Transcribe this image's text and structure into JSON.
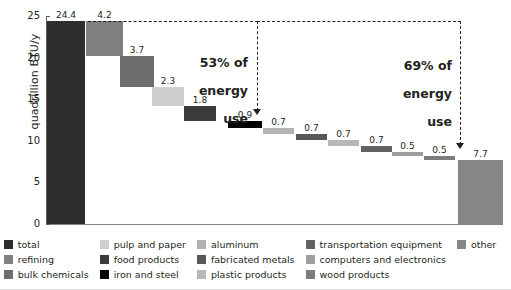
{
  "chart_data": {
    "type": "bar",
    "chart_style": "waterfall",
    "title": "",
    "xlabel": "",
    "ylabel": "quadrillion BTU/y",
    "ylim": [
      0,
      25
    ],
    "yticks": [
      0,
      5,
      10,
      15,
      20,
      25
    ],
    "ytick_labels": [
      "0",
      "5",
      "10",
      "15",
      "20",
      "25"
    ],
    "grid": false,
    "legend_position": "bottom",
    "categories": [
      "total",
      "refining",
      "bulk chemicals",
      "pulp and paper",
      "food products",
      "iron and steel",
      "aluminum",
      "fabricated metals",
      "plastic products",
      "transportation equipment",
      "computers and electronics",
      "wood products",
      "other"
    ],
    "values": [
      24.4,
      4.2,
      3.7,
      2.3,
      1.8,
      0.9,
      0.7,
      0.7,
      0.7,
      0.7,
      0.5,
      0.5,
      7.7
    ],
    "value_labels": [
      "24.4",
      "4.2",
      "3.7",
      "2.3",
      "1.8",
      "0.9",
      "0.7",
      "0.7",
      "0.7",
      "0.7",
      "0.5",
      "0.5",
      "7.7"
    ],
    "colors": [
      "#2f2c2d",
      "#808080",
      "#6e6e6e",
      "#cfcfcf",
      "#3d3a3b",
      "#000000",
      "#b3b3b3",
      "#58585a",
      "#b8b8b8",
      "#636363",
      "#9f9f9f",
      "#7c7c7c",
      "#868686"
    ],
    "annotations": [
      {
        "text": "53% of\nenergy\nuse",
        "percent": "53%",
        "bracket_from_bar": "refining",
        "bracket_to_bar": "iron and steel"
      },
      {
        "text": "69% of\nenergy\nuse",
        "percent": "69%",
        "bracket_from_bar": "refining",
        "bracket_to_bar": "wood products"
      }
    ]
  },
  "axis": {
    "y_title": "quadrillion BTU/y",
    "ticks": [
      "25",
      "20",
      "15",
      "10",
      "5",
      "0"
    ]
  },
  "annotations": {
    "left": {
      "line1": "53% of",
      "line2": "energy",
      "line3": "use"
    },
    "right": {
      "line1": "69% of",
      "line2": "energy",
      "line3": "use"
    }
  },
  "legend": {
    "columns": [
      [
        {
          "label": "total",
          "color": "#2f2c2d"
        },
        {
          "label": "refining",
          "color": "#808080"
        },
        {
          "label": "bulk chemicals",
          "color": "#6e6e6e"
        }
      ],
      [
        {
          "label": "pulp and paper",
          "color": "#cfcfcf"
        },
        {
          "label": "food products",
          "color": "#3d3a3b"
        },
        {
          "label": "iron and steel",
          "color": "#000000"
        }
      ],
      [
        {
          "label": "aluminum",
          "color": "#b3b3b3"
        },
        {
          "label": "fabricated metals",
          "color": "#58585a"
        },
        {
          "label": "plastic products",
          "color": "#b8b8b8"
        }
      ],
      [
        {
          "label": "transportation equipment",
          "color": "#636363"
        },
        {
          "label": "computers and electronics",
          "color": "#9f9f9f"
        },
        {
          "label": "wood products",
          "color": "#7c7c7c"
        }
      ],
      [
        {
          "label": "other",
          "color": "#868686"
        }
      ]
    ]
  }
}
